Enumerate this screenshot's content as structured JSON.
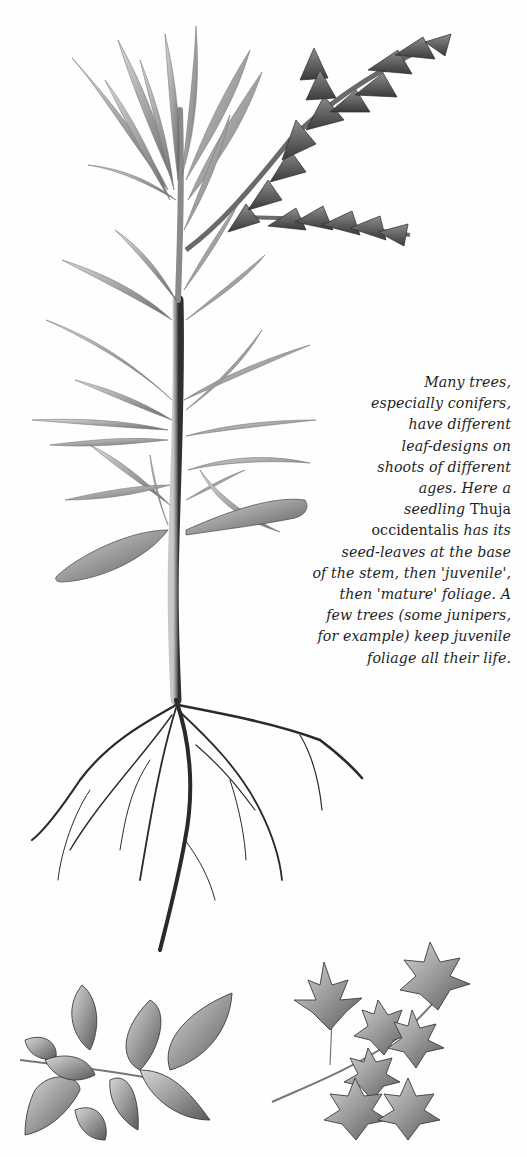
{
  "page": {
    "background": "#ffffff",
    "ink_color": "#1e1e1e"
  },
  "illustrations": {
    "main": {
      "subject": "Thuja occidentalis seedling",
      "parts": [
        "seed-leaves",
        "juvenile foliage",
        "mature foliage",
        "root system"
      ]
    },
    "bottom_left": {
      "subject": "toothed ovate leaf sprig"
    },
    "bottom_right": {
      "subject": "maple leaf sprig"
    }
  },
  "caption": {
    "lines": [
      {
        "segments": [
          {
            "text": "Many trees,",
            "style": "italic"
          }
        ]
      },
      {
        "segments": [
          {
            "text": "especially conifers,",
            "style": "italic"
          }
        ]
      },
      {
        "segments": [
          {
            "text": "have different",
            "style": "italic"
          }
        ]
      },
      {
        "segments": [
          {
            "text": "leaf-designs on",
            "style": "italic"
          }
        ]
      },
      {
        "segments": [
          {
            "text": "shoots of different",
            "style": "italic"
          }
        ]
      },
      {
        "segments": [
          {
            "text": "ages. Here a",
            "style": "italic"
          }
        ]
      },
      {
        "segments": [
          {
            "text": "seedling ",
            "style": "italic"
          },
          {
            "text": "Thuja",
            "style": "roman"
          }
        ]
      },
      {
        "segments": [
          {
            "text": "occidentalis ",
            "style": "roman"
          },
          {
            "text": "has its",
            "style": "italic"
          }
        ]
      },
      {
        "segments": [
          {
            "text": "seed-leaves at the base",
            "style": "italic"
          }
        ]
      },
      {
        "segments": [
          {
            "text": "of the stem, then 'juvenile',",
            "style": "italic"
          }
        ]
      },
      {
        "segments": [
          {
            "text": "then 'mature' foliage. A",
            "style": "italic"
          }
        ]
      },
      {
        "segments": [
          {
            "text": "few trees (some junipers,",
            "style": "italic"
          }
        ]
      },
      {
        "segments": [
          {
            "text": "for example) keep juvenile",
            "style": "italic"
          }
        ]
      },
      {
        "segments": [
          {
            "text": "foliage all their life.",
            "style": "italic"
          }
        ]
      }
    ]
  }
}
